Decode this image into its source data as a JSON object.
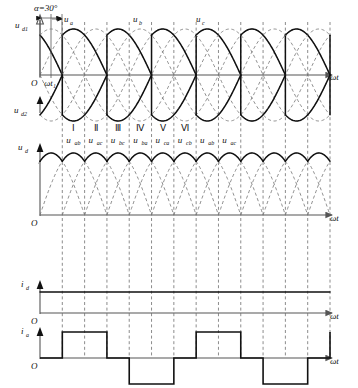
{
  "figure": {
    "kind": "three-phase-bridge-rectifier-waveforms",
    "alpha_annotation": "α=30°",
    "omega_t_axis_label": "ωt",
    "origin_label": "O",
    "commutation_instant_label": "ωt₁"
  },
  "panels": {
    "panel1": {
      "name": "positive-group-output",
      "y_label": "u",
      "y_label_sub": "d1",
      "phase_labels": [
        {
          "text": "u",
          "sub": "a"
        },
        {
          "text": "u",
          "sub": "b"
        },
        {
          "text": "u",
          "sub": "c"
        }
      ]
    },
    "panel2": {
      "name": "negative-group-output",
      "y_label": "u",
      "y_label_sub": "d2"
    },
    "panel3": {
      "name": "dc-output-voltage",
      "y_label": "u",
      "y_label_sub": "d",
      "sectors": [
        "Ⅰ",
        "Ⅱ",
        "Ⅲ",
        "Ⅳ",
        "Ⅴ",
        "Ⅵ"
      ],
      "line_voltages": [
        {
          "text": "u",
          "sub": "ab"
        },
        {
          "text": "u",
          "sub": "ac"
        },
        {
          "text": "u",
          "sub": "bc"
        },
        {
          "text": "u",
          "sub": "ba"
        },
        {
          "text": "u",
          "sub": "ca"
        },
        {
          "text": "u",
          "sub": "cb"
        },
        {
          "text": "u",
          "sub": "ab"
        },
        {
          "text": "u",
          "sub": "ac"
        }
      ]
    },
    "panel4": {
      "name": "dc-current",
      "y_label": "i",
      "y_label_sub": "d"
    },
    "panel5": {
      "name": "phase-a-current",
      "y_label": "i",
      "y_label_sub": "a"
    }
  },
  "chart_data": {
    "type": "line",
    "xlabel": "ωt",
    "alpha_deg": 30,
    "phases": {
      "names": [
        "u_a",
        "u_b",
        "u_c"
      ],
      "phase_shift_deg": [
        0,
        -120,
        -240
      ],
      "amplitude": 1.0
    },
    "series": [
      {
        "name": "u_d1",
        "description": "positive-group (common cathode) output voltage, conduction segments of u_a,u_b,u_c delayed 30 degrees",
        "segment_span_deg": 120,
        "firing_delay_deg": 30
      },
      {
        "name": "u_d2",
        "description": "negative-group (common anode) output voltage, mirror of positive group below axis",
        "segment_span_deg": 120,
        "firing_delay_deg": 30
      },
      {
        "name": "u_d",
        "description": "total dc output = u_d1 - u_d2, six-pulse line voltage waveform",
        "pulses_per_cycle": 6,
        "segment_span_deg": 60,
        "firing_delay_deg": 30,
        "line_voltage_sequence": [
          "u_ab",
          "u_ac",
          "u_bc",
          "u_ba",
          "u_ca",
          "u_cb",
          "u_ab",
          "u_ac"
        ]
      },
      {
        "name": "i_d",
        "description": "constant (ripple-free) dc load current",
        "value": 1.0,
        "waveform": "constant"
      },
      {
        "name": "i_a",
        "description": "phase-a line current, quasi-square wave 120 degrees positive / 60 off / 120 negative / 60 off",
        "levels": [
          0,
          1,
          0,
          -1
        ],
        "positive_span_deg": 120,
        "negative_span_deg": 120,
        "zero_span_deg": 60
      }
    ],
    "grid": true,
    "legend": "none"
  }
}
